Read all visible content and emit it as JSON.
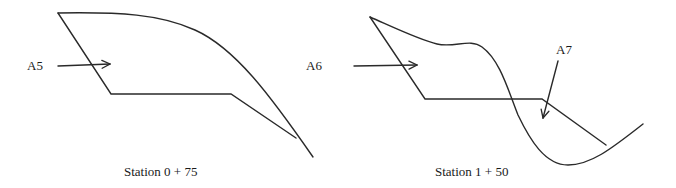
{
  "figures": [
    {
      "id": "station-0-75",
      "caption": "Station 0 + 75",
      "area_labels": [
        {
          "text": "A5"
        }
      ]
    },
    {
      "id": "station-1-50",
      "caption": "Station 1 + 50",
      "area_labels": [
        {
          "text": "A6"
        },
        {
          "text": "A7"
        }
      ]
    }
  ],
  "colors": {
    "line": "#2a2a2a",
    "text": "#1a1a1a",
    "background": "#ffffff"
  }
}
